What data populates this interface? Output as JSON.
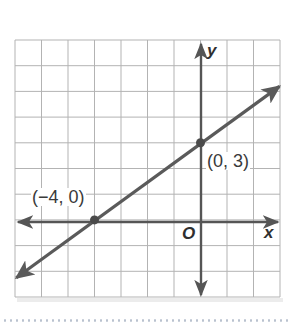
{
  "figure": {
    "type": "coordinate-plane-line-graph",
    "axes": {
      "x_label": "x",
      "y_label": "y",
      "origin_label": "O",
      "x_range": [
        -7,
        3
      ],
      "y_range": [
        -3,
        7
      ],
      "grid_step": 1
    },
    "line": {
      "equation": "y = (3/4)x + 3",
      "slope": 0.75,
      "y_intercept": 3,
      "both_ends_arrowed": true
    },
    "points": [
      {
        "x": -4,
        "y": 0,
        "label": "(−4, 0)"
      },
      {
        "x": 0,
        "y": 3,
        "label": "(0, 3)"
      }
    ],
    "colors": {
      "grid": "#b3b3b3",
      "axes": "#555555",
      "line": "#5a5a5a",
      "points": "#4a4a4a",
      "dotted_separator": "#b9c2cf"
    }
  },
  "chart_data": {
    "type": "line",
    "title": "",
    "xlabel": "x",
    "ylabel": "y",
    "xlim": [
      -7,
      3
    ],
    "ylim": [
      -3,
      7
    ],
    "grid": true,
    "series": [
      {
        "name": "line",
        "x": [
          -7,
          -4,
          0,
          3
        ],
        "y": [
          -2.25,
          0,
          3,
          5.25
        ]
      }
    ],
    "annotations": [
      {
        "text": "(−4, 0)",
        "x": -4,
        "y": 0
      },
      {
        "text": "(0, 3)",
        "x": 0,
        "y": 3
      },
      {
        "text": "O",
        "x": 0,
        "y": 0
      }
    ]
  }
}
